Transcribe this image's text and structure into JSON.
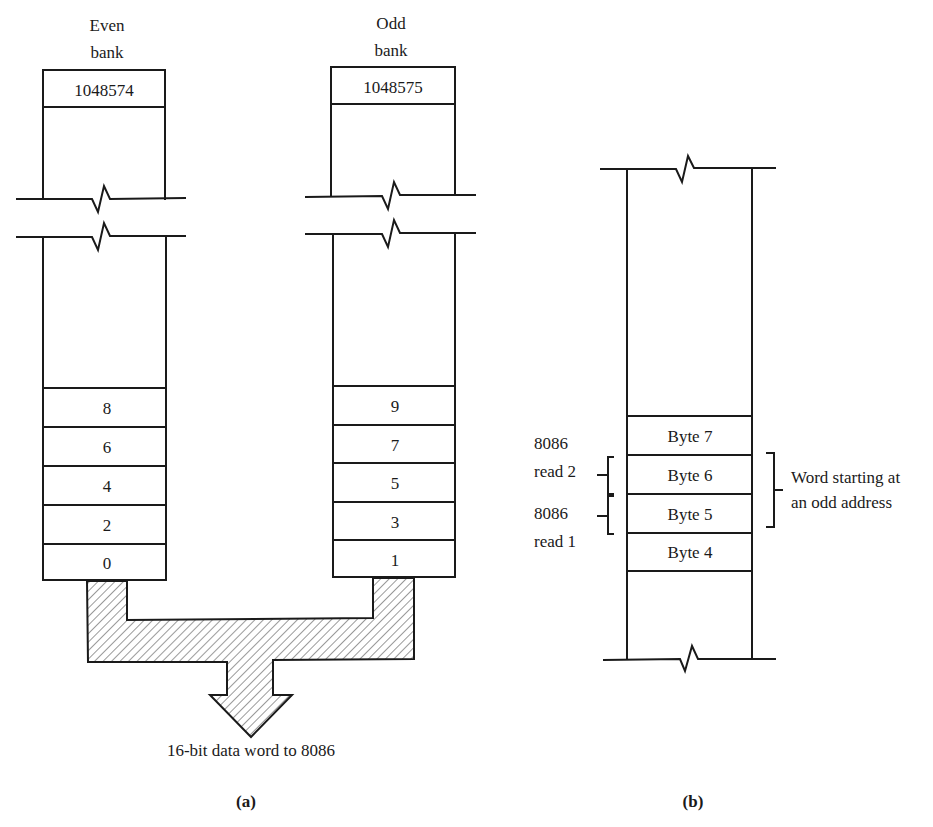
{
  "panel_a": {
    "even_bank": {
      "title_line1": "Even",
      "title_line2": "bank",
      "top_address": "1048574",
      "cells": [
        "8",
        "6",
        "4",
        "2",
        "0"
      ]
    },
    "odd_bank": {
      "title_line1": "Odd",
      "title_line2": "bank",
      "top_address": "1048575",
      "cells": [
        "9",
        "7",
        "5",
        "3",
        "1"
      ]
    },
    "bus_label": "16-bit data word to 8086",
    "caption": "(a)"
  },
  "panel_b": {
    "cells": [
      "Byte 7",
      "Byte 6",
      "Byte 5",
      "Byte 4"
    ],
    "read2_line1": "8086",
    "read2_line2": "read 2",
    "read1_line1": "8086",
    "read1_line2": "read 1",
    "word_label_line1": "Word starting at",
    "word_label_line2": "an odd address",
    "caption": "(b)"
  },
  "colors": {
    "line": "#1a1a1a",
    "hatch": "#555555",
    "background": "#ffffff"
  }
}
